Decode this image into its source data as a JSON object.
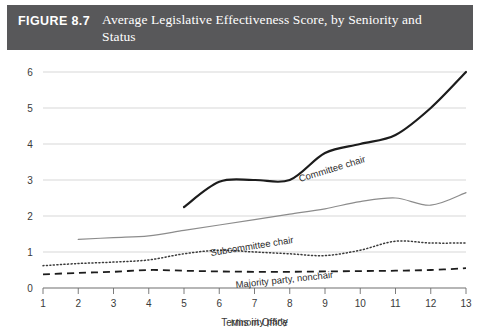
{
  "header": {
    "figure_number": "FIGURE 8.7",
    "title": "Average Legislative Effectiveness Score, by Seniority and Status",
    "band_color": "#58585a",
    "text_color": "#ffffff"
  },
  "chart_data": {
    "type": "line",
    "title": "Average Legislative Effectiveness Score, by Seniority and Status",
    "xlabel": "Terms in Office",
    "ylabel": "",
    "xlim": [
      1,
      13
    ],
    "ylim": [
      0,
      6
    ],
    "x": [
      1,
      2,
      3,
      4,
      5,
      6,
      7,
      8,
      9,
      10,
      11,
      12,
      13
    ],
    "xticks": [
      "1",
      "2",
      "3",
      "4",
      "5",
      "6",
      "7",
      "8",
      "9",
      "10",
      "11",
      "12",
      "13"
    ],
    "yticks": [
      "0",
      "1",
      "2",
      "3",
      "4",
      "5",
      "6"
    ],
    "grid": "horizontal",
    "legend_position": "inline-annotations",
    "series": [
      {
        "name": "Committee chair",
        "style": "solid-thick",
        "color": "#1c1c1c",
        "x": [
          5,
          6,
          7,
          8,
          9,
          10,
          11,
          12,
          13
        ],
        "values": [
          2.25,
          2.95,
          3.0,
          3.0,
          3.75,
          4.0,
          4.25,
          5.0,
          6.0
        ],
        "label": "Committee chair",
        "label_rotation": -17
      },
      {
        "name": "Subcommittee chair",
        "style": "solid-thin",
        "color": "#8c8c8c",
        "x": [
          2,
          3,
          4,
          5,
          6,
          7,
          8,
          9,
          10,
          11,
          12,
          13
        ],
        "values": [
          1.35,
          1.4,
          1.45,
          1.6,
          1.75,
          1.9,
          2.05,
          2.2,
          2.4,
          2.5,
          2.3,
          2.65
        ],
        "label": "Subcommittee chair",
        "label_rotation": -9
      },
      {
        "name": "Majority party, nonchair",
        "style": "dotted",
        "color": "#3a3a3a",
        "x": [
          1,
          2,
          3,
          4,
          5,
          6,
          7,
          8,
          9,
          10,
          11,
          12,
          13
        ],
        "values": [
          0.62,
          0.68,
          0.72,
          0.78,
          0.95,
          1.05,
          1.0,
          0.95,
          0.9,
          1.05,
          1.3,
          1.25,
          1.25
        ],
        "label": "Majority party, nonchair",
        "label_rotation": -6
      },
      {
        "name": "Minority party",
        "style": "dashed",
        "color": "#1c1c1c",
        "x": [
          1,
          2,
          3,
          4,
          5,
          6,
          7,
          8,
          9,
          10,
          11,
          12,
          13
        ],
        "values": [
          0.38,
          0.42,
          0.45,
          0.5,
          0.48,
          0.46,
          0.45,
          0.45,
          0.46,
          0.47,
          0.48,
          0.5,
          0.55
        ],
        "label": "Minority party",
        "label_rotation": -2
      }
    ]
  }
}
